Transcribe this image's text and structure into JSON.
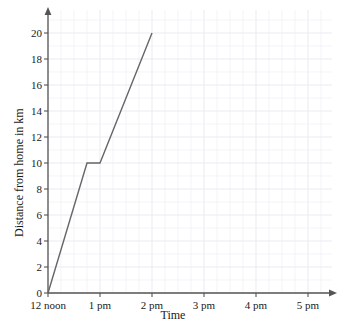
{
  "chart_data": {
    "type": "line",
    "title": "",
    "xlabel": "Time",
    "ylabel": "Distance from home in km",
    "x_tick_labels": [
      "12 noon",
      "1 pm",
      "2 pm",
      "3 pm",
      "4 pm",
      "5 pm"
    ],
    "x_tick_values": [
      12,
      13,
      14,
      15,
      16,
      17
    ],
    "y_tick_labels": [
      "0",
      "2",
      "4",
      "6",
      "8",
      "10",
      "12",
      "14",
      "16",
      "18",
      "20"
    ],
    "y_tick_values": [
      0,
      2,
      4,
      6,
      8,
      10,
      12,
      14,
      16,
      18,
      20
    ],
    "xlim": [
      12,
      17.5
    ],
    "ylim": [
      0,
      21.5
    ],
    "grid": true,
    "grid_minor": true,
    "legend": "none",
    "series": [
      {
        "name": "journey",
        "points": [
          {
            "x": 12.0,
            "y": 0,
            "x_label": "12 noon"
          },
          {
            "x": 12.75,
            "y": 10,
            "x_label": "12:45 pm"
          },
          {
            "x": 13.0,
            "y": 10,
            "x_label": "1 pm"
          },
          {
            "x": 14.0,
            "y": 20,
            "x_label": "2 pm"
          }
        ]
      }
    ],
    "line_color": "#666666",
    "grid_color": "#e9e9f0",
    "axis_color": "#555555"
  },
  "axes": {
    "x_title": "Time",
    "y_title": "Distance from home in km"
  }
}
